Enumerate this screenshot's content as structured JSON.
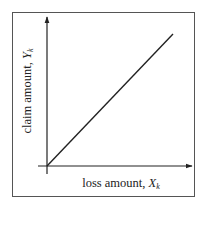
{
  "diagram": {
    "type": "line-plot-schematic",
    "x_axis": {
      "label_text": "loss amount, ",
      "label_var": "X",
      "label_sub": "k"
    },
    "y_axis": {
      "label_text": "claim amount, ",
      "label_var": "Y",
      "label_sub": "k"
    },
    "relationship": "Y_k = X_k (45-degree line from origin)",
    "colors": {
      "line": "#222222",
      "frame": "#555555",
      "background": "#ffffff"
    }
  }
}
